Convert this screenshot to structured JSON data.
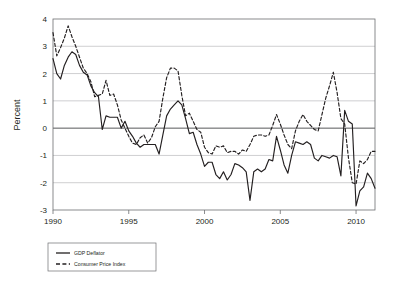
{
  "chart_data": {
    "type": "line",
    "title": "",
    "xlabel": "",
    "ylabel": "Percent",
    "xlim": [
      1990,
      2011.25
    ],
    "ylim": [
      -3,
      4
    ],
    "xticks": [
      "1990",
      "1995",
      "2000",
      "2005",
      "2010"
    ],
    "xtick_values": [
      1990,
      1995,
      2000,
      2005,
      2010
    ],
    "yticks": [
      "4",
      "3",
      "2",
      "1",
      "0",
      "-1",
      "-2",
      "-3"
    ],
    "ytick_values": [
      4,
      3,
      2,
      1,
      0,
      -1,
      -2,
      -3
    ],
    "grid": "horizontal",
    "legend_position": "below-left",
    "zero_line": 0,
    "x": [
      1990,
      1990.25,
      1990.5,
      1990.75,
      1991,
      1991.25,
      1991.5,
      1991.75,
      1992,
      1992.25,
      1992.5,
      1992.75,
      1993,
      1993.25,
      1993.5,
      1993.75,
      1994,
      1994.25,
      1994.5,
      1994.75,
      1995,
      1995.25,
      1995.5,
      1995.75,
      1996,
      1996.25,
      1996.5,
      1996.75,
      1997,
      1997.25,
      1997.5,
      1997.75,
      1998,
      1998.25,
      1998.5,
      1998.75,
      1999,
      1999.25,
      1999.5,
      1999.75,
      2000,
      2000.25,
      2000.5,
      2000.75,
      2001,
      2001.25,
      2001.5,
      2001.75,
      2002,
      2002.25,
      2002.5,
      2002.75,
      2003,
      2003.25,
      2003.5,
      2003.75,
      2004,
      2004.25,
      2004.5,
      2004.75,
      2005,
      2005.25,
      2005.5,
      2005.75,
      2006,
      2006.25,
      2006.5,
      2006.75,
      2007,
      2007.25,
      2007.5,
      2007.75,
      2008,
      2008.25,
      2008.5,
      2008.75,
      2009,
      2009.25,
      2009.5,
      2009.75,
      2010,
      2010.25,
      2010.5,
      2010.75,
      2011,
      2011.25
    ],
    "series": [
      {
        "name": "GDP Deflator",
        "style": "solid",
        "color": "#231f20",
        "values": [
          2.55,
          2.0,
          1.8,
          2.3,
          2.6,
          2.8,
          2.7,
          2.3,
          2.05,
          1.95,
          1.55,
          1.3,
          1.15,
          -0.05,
          0.45,
          0.4,
          0.4,
          0.4,
          0.0,
          0.25,
          -0.1,
          -0.3,
          -0.55,
          -0.7,
          -0.6,
          -0.6,
          -0.6,
          -0.6,
          -0.95,
          -0.25,
          0.45,
          0.7,
          0.85,
          1.0,
          0.85,
          0.35,
          -0.2,
          -0.15,
          -0.6,
          -0.95,
          -1.4,
          -1.25,
          -1.25,
          -1.7,
          -1.85,
          -1.6,
          -1.9,
          -1.7,
          -1.3,
          -1.35,
          -1.45,
          -1.6,
          -2.65,
          -1.6,
          -1.5,
          -1.6,
          -1.5,
          -1.15,
          -1.2,
          -0.3,
          -0.8,
          -1.35,
          -1.65,
          -1.0,
          -0.5,
          -0.55,
          -0.6,
          -0.5,
          -0.6,
          -1.1,
          -1.2,
          -1.0,
          -1.05,
          -1.1,
          -1.0,
          -1.05,
          -1.75,
          0.65,
          0.25,
          0.15,
          -2.85,
          -2.3,
          -2.15,
          -1.65,
          -1.85,
          -2.2
        ]
      },
      {
        "name": "Consumer Price Index",
        "style": "dashed",
        "color": "#231f20",
        "values": [
          3.5,
          2.65,
          2.95,
          3.3,
          3.75,
          3.35,
          3.0,
          2.6,
          2.2,
          2.0,
          1.7,
          1.15,
          1.2,
          1.25,
          1.75,
          1.2,
          1.25,
          0.85,
          0.3,
          0.0,
          -0.3,
          -0.55,
          -0.6,
          -0.35,
          -0.25,
          -0.55,
          -0.35,
          0.05,
          0.25,
          1.1,
          1.85,
          2.2,
          2.2,
          2.1,
          1.2,
          0.45,
          0.55,
          0.25,
          -0.05,
          -0.15,
          -0.7,
          -0.9,
          -0.95,
          -0.65,
          -0.7,
          -0.65,
          -0.9,
          -0.85,
          -0.85,
          -0.95,
          -0.8,
          -0.85,
          -0.6,
          -0.3,
          -0.25,
          -0.25,
          -0.3,
          -0.25,
          0.1,
          0.5,
          0.15,
          -0.25,
          -0.6,
          -0.75,
          -0.1,
          0.25,
          0.5,
          0.25,
          0.1,
          -0.05,
          -0.1,
          0.5,
          1.1,
          1.55,
          2.05,
          1.3,
          0.35,
          0.15,
          -1.1,
          -2.0,
          -2.05,
          -1.2,
          -1.3,
          -1.15,
          -0.85,
          -0.85
        ]
      }
    ]
  },
  "legend": {
    "items": [
      {
        "label": "GDP Deflator",
        "style": "solid"
      },
      {
        "label": "Consumer Price Index",
        "style": "dashed"
      }
    ]
  },
  "axes": {
    "y_title": "Percent"
  }
}
